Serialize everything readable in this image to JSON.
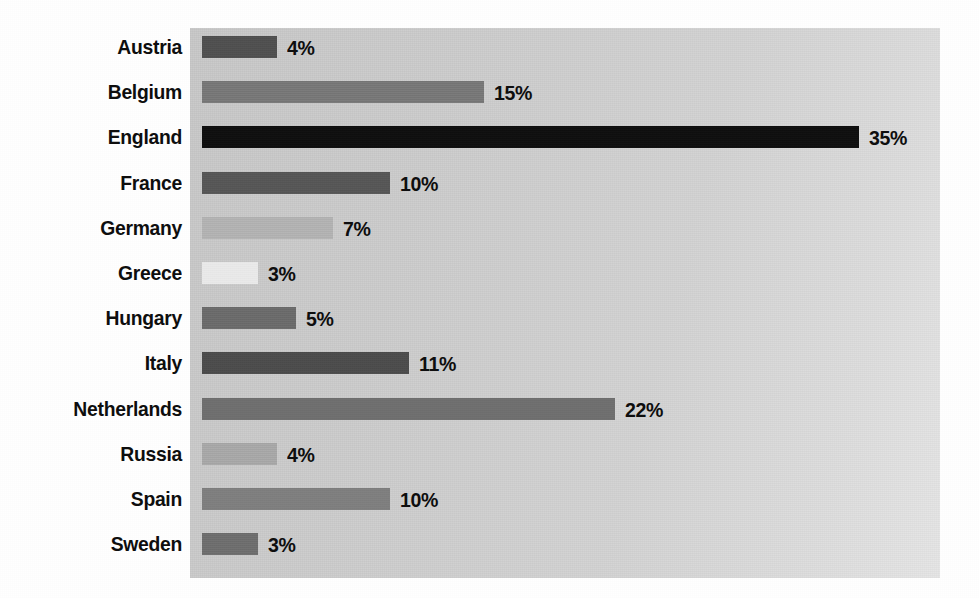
{
  "chart_data": {
    "type": "bar",
    "orientation": "horizontal",
    "title": "",
    "subtitle": "",
    "xlabel": "",
    "ylabel": "",
    "grid": false,
    "legend": null,
    "axis_ticks_visible": false,
    "value_suffix": "%",
    "xlim": [
      0,
      39
    ],
    "categories": [
      "Austria",
      "Belgium",
      "England",
      "France",
      "Germany",
      "Greece",
      "Hungary",
      "Italy",
      "Netherlands",
      "Russia",
      "Spain",
      "Sweden"
    ],
    "values": [
      4,
      15,
      35,
      10,
      7,
      3,
      5,
      11,
      22,
      4,
      10,
      3
    ],
    "value_labels": [
      "4%",
      "15%",
      "35%",
      "10%",
      "7%",
      "3%",
      "5%",
      "11%",
      "22%",
      "4%",
      "10%",
      "3%"
    ],
    "bar_colors": [
      "#4f4f4f",
      "#787878",
      "#0d0d0d",
      "#565656",
      "#b4b4b4",
      "#ececec",
      "#6b6b6b",
      "#4b4b4b",
      "#6f6f6f",
      "#a9a9a9",
      "#7f7f7f",
      "#6e6e6e"
    ],
    "bars": [
      {
        "category": "Austria",
        "value": 4,
        "label": "4%",
        "color": "#4f4f4f"
      },
      {
        "category": "Belgium",
        "value": 15,
        "label": "15%",
        "color": "#787878"
      },
      {
        "category": "England",
        "value": 35,
        "label": "35%",
        "color": "#0d0d0d"
      },
      {
        "category": "France",
        "value": 10,
        "label": "10%",
        "color": "#565656"
      },
      {
        "category": "Germany",
        "value": 7,
        "label": "7%",
        "color": "#b4b4b4"
      },
      {
        "category": "Greece",
        "value": 3,
        "label": "3%",
        "color": "#ececec"
      },
      {
        "category": "Hungary",
        "value": 5,
        "label": "5%",
        "color": "#6b6b6b"
      },
      {
        "category": "Italy",
        "value": 11,
        "label": "11%",
        "color": "#4b4b4b"
      },
      {
        "category": "Netherlands",
        "value": 22,
        "label": "22%",
        "color": "#6f6f6f"
      },
      {
        "category": "Russia",
        "value": 4,
        "label": "4%",
        "color": "#a9a9a9"
      },
      {
        "category": "Spain",
        "value": 10,
        "label": "10%",
        "color": "#7f7f7f"
      },
      {
        "category": "Sweden",
        "value": 3,
        "label": "3%",
        "color": "#6e6e6e"
      }
    ]
  },
  "style": {
    "plot_background_color": "#d2d2d2",
    "page_background_color": "#ffffff",
    "label_color": "#0d0d0d"
  }
}
